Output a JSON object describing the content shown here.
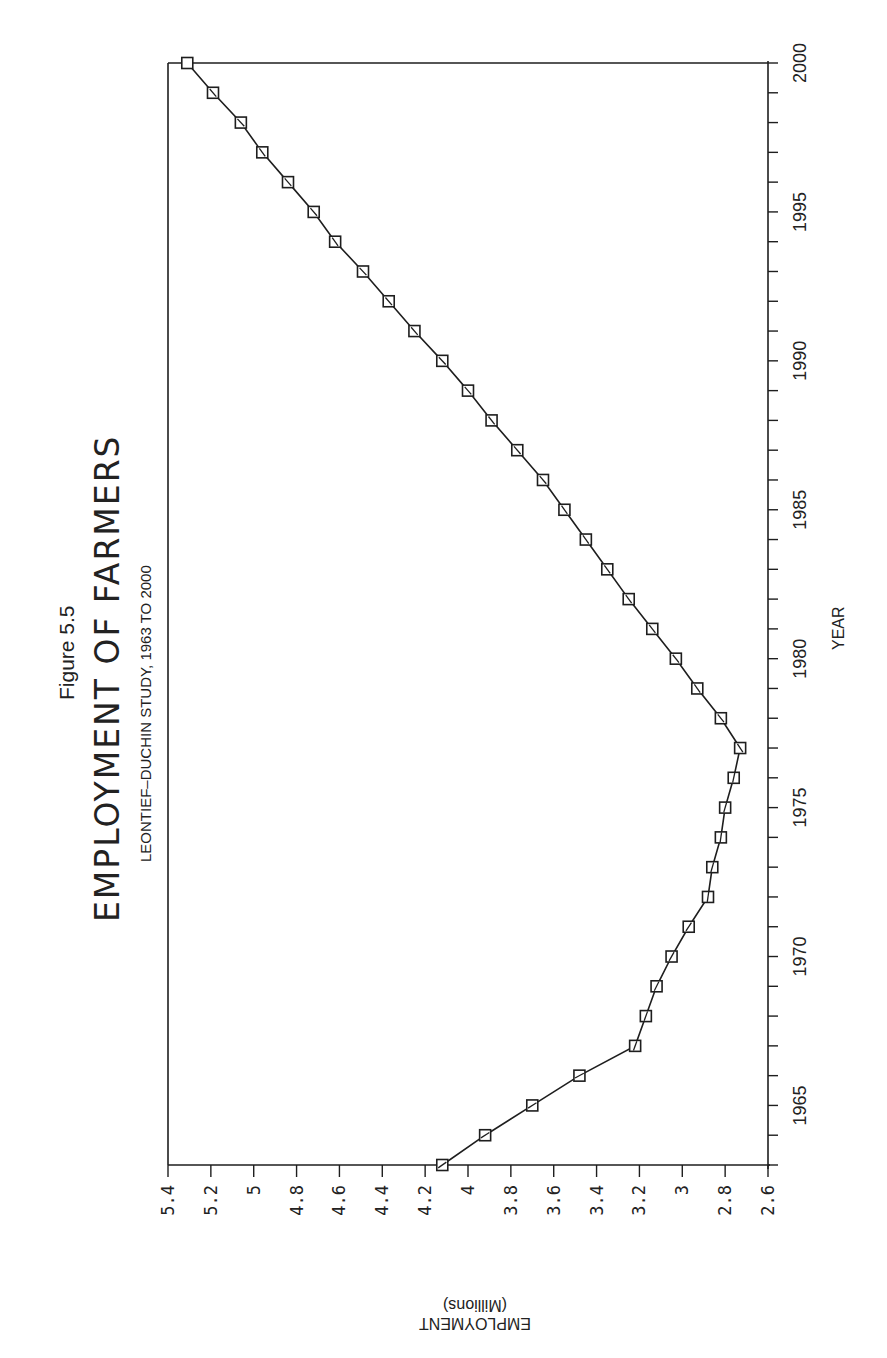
{
  "figure_label": "Figure 5.5",
  "chart_data": {
    "type": "line",
    "title": "EMPLOYMENT OF FARMERS",
    "subtitle": "LEONTIEF–DUCHIN STUDY, 1963 TO 2000",
    "xlabel": "YEAR",
    "ylabel": "EMPLOYMENT (Millions)",
    "ylabel_line1": "EMPLOYMENT",
    "ylabel_line2": "(Millions)",
    "orientation": "rotated 90° clockwise (year axis vertical on right, employment axis horizontal at bottom, reversed)",
    "marker": "square",
    "grid": false,
    "legend": null,
    "xlim": [
      1963,
      2000
    ],
    "ylim": [
      2.6,
      5.4
    ],
    "x_ticks": [
      1965,
      1970,
      1975,
      1980,
      1985,
      1990,
      1995,
      2000
    ],
    "y_ticks": [
      "5.4",
      "5.2",
      "5",
      "4.8",
      "4.6",
      "4.4",
      "4.2",
      "4",
      "3.8",
      "3.6",
      "3.4",
      "3.2",
      "3",
      "2.8",
      "2.6"
    ],
    "x": [
      1963,
      1964,
      1965,
      1966,
      1967,
      1968,
      1969,
      1970,
      1971,
      1972,
      1973,
      1974,
      1975,
      1976,
      1977,
      1978,
      1979,
      1980,
      1981,
      1982,
      1983,
      1984,
      1985,
      1986,
      1987,
      1988,
      1989,
      1990,
      1991,
      1992,
      1993,
      1994,
      1995,
      1996,
      1997,
      1998,
      1999,
      2000
    ],
    "series": [
      {
        "name": "Employment of farmers",
        "values": [
          4.12,
          3.92,
          3.7,
          3.48,
          3.22,
          3.17,
          3.12,
          3.05,
          2.97,
          2.88,
          2.86,
          2.82,
          2.8,
          2.76,
          2.73,
          2.82,
          2.93,
          3.03,
          3.14,
          3.25,
          3.35,
          3.45,
          3.55,
          3.65,
          3.77,
          3.89,
          4.0,
          4.12,
          4.25,
          4.37,
          4.49,
          4.62,
          4.72,
          4.84,
          4.96,
          5.06,
          5.19,
          5.31
        ]
      }
    ]
  }
}
